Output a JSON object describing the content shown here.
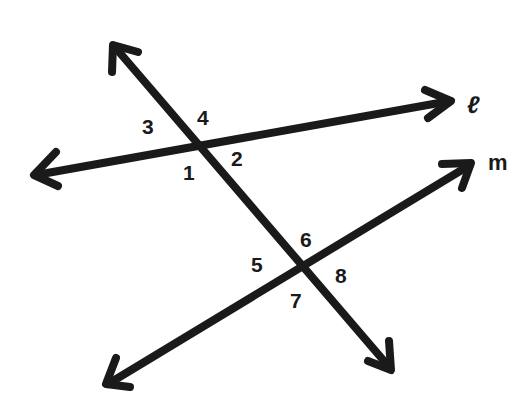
{
  "diagram": {
    "colors": {
      "stroke": "#1a1a1a",
      "background": "#ffffff"
    },
    "lines": [
      {
        "id": "l",
        "label": "ℓ"
      },
      {
        "id": "m",
        "label": "m"
      },
      {
        "id": "transversal",
        "label": ""
      }
    ],
    "angles": [
      {
        "id": "1",
        "label": "1"
      },
      {
        "id": "2",
        "label": "2"
      },
      {
        "id": "3",
        "label": "3"
      },
      {
        "id": "4",
        "label": "4"
      },
      {
        "id": "5",
        "label": "5"
      },
      {
        "id": "6",
        "label": "6"
      },
      {
        "id": "7",
        "label": "7"
      },
      {
        "id": "8",
        "label": "8"
      }
    ]
  }
}
